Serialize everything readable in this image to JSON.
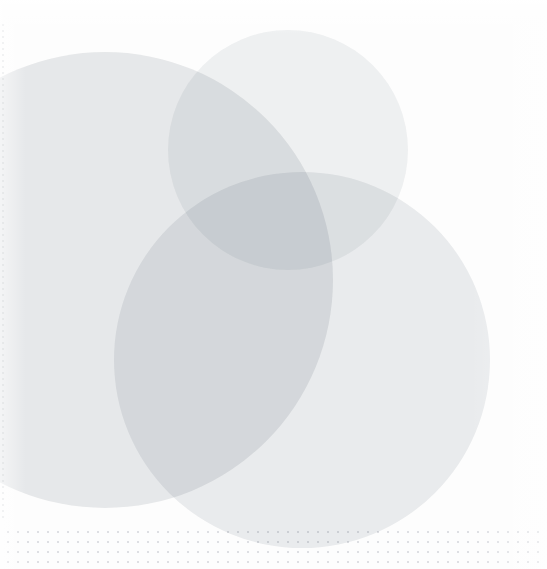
{
  "artwork": {
    "title": "Abstract overlapping circles",
    "description": "Three large translucent light-grey circles overlapping on a near-white canvas, with a faint dot-grid band along the bottom edge and a dotted vertical rule at the left margin.",
    "width_px": 547,
    "height_px": 569,
    "background_color": "#fdfdfd",
    "page_color": "#ffffff"
  },
  "shapes": [
    {
      "name": "circle-left",
      "label": "Large left circle",
      "center_x": 105,
      "center_y": 280,
      "radius": 228,
      "fill": "#e3e5e7",
      "opacity": 0.8
    },
    {
      "name": "circle-top",
      "label": "Upper middle circle",
      "center_x": 288,
      "center_y": 150,
      "radius": 120,
      "fill": "#eef0f1",
      "opacity": 0.85
    },
    {
      "name": "circle-bottom-right",
      "label": "Lower right circle",
      "center_x": 302,
      "center_y": 360,
      "radius": 188,
      "fill": "#e8eaec",
      "opacity": 0.85
    }
  ],
  "decorations": {
    "dot_grid": {
      "name": "dot-grid",
      "label": "Dot grid band",
      "dot_color": "#d8dade",
      "spacing_px": 10,
      "band_height_px": 44,
      "position": "bottom"
    },
    "left_rule": {
      "name": "left-dotted-rule",
      "label": "Dotted vertical rule",
      "color": "#dcdee1",
      "dash_px": 2,
      "gap_px": 4,
      "position": "left"
    }
  }
}
